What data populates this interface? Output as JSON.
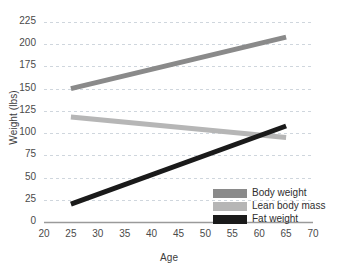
{
  "chart_data": {
    "type": "line",
    "title": "",
    "xlabel": "Age",
    "ylabel": "Weight (lbs)",
    "xlim": [
      20,
      70
    ],
    "ylim": [
      0,
      225
    ],
    "xticks": [
      20,
      25,
      30,
      35,
      40,
      45,
      50,
      55,
      60,
      65,
      70
    ],
    "yticks": [
      0,
      25,
      50,
      75,
      100,
      125,
      150,
      175,
      200,
      225
    ],
    "grid": "horizontal-dashed",
    "legend_position": "bottom-right-inside",
    "x": [
      25,
      65
    ],
    "series": [
      {
        "name": "Body weight",
        "values": [
          150,
          208
        ],
        "color": "#8a8a8a"
      },
      {
        "name": "Lean body mass",
        "values": [
          118,
          95
        ],
        "color": "#b6b6b6"
      },
      {
        "name": "Fat weight",
        "values": [
          20,
          108
        ],
        "color": "#1a1a1a"
      }
    ],
    "annotations": [
      "Fat weight and lean body mass curves intersect near age 61 at about 100 lbs"
    ]
  },
  "axes": {
    "y_title": "Weight (lbs)",
    "x_title": "Age",
    "y_ticks": [
      "225",
      "200",
      "175",
      "150",
      "125",
      "100",
      "75",
      "50",
      "25",
      "0"
    ],
    "x_ticks": [
      "20",
      "25",
      "30",
      "35",
      "40",
      "45",
      "50",
      "55",
      "60",
      "65",
      "70"
    ]
  },
  "legend": {
    "items": [
      {
        "label": "Body weight",
        "color": "#8a8a8a"
      },
      {
        "label": "Lean body mass",
        "color": "#b6b6b6"
      },
      {
        "label": "Fat weight",
        "color": "#1a1a1a"
      }
    ]
  },
  "colors": {
    "gridline": "#cfd6dd",
    "axis_line": "#9a9a9a",
    "tick_text": "#4a4a4a",
    "title_text": "#3d3d3d",
    "background": "#ffffff"
  }
}
